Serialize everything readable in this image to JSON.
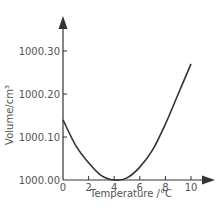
{
  "chart_data": {
    "type": "line",
    "title": "",
    "xlabel": "Temperature /°C",
    "ylabel": "Volume/cm³",
    "xlim": [
      0,
      10
    ],
    "ylim": [
      1000.0,
      1000.3
    ],
    "x_ticks": [
      "0",
      "2",
      "4",
      "6",
      "8",
      "10"
    ],
    "y_ticks": [
      "1000.00",
      "1000.10",
      "1000.20",
      "1000.30"
    ],
    "grid": false,
    "legend": null,
    "series": [
      {
        "name": "Volume of water",
        "x": [
          0,
          1,
          2,
          3,
          4,
          5,
          6,
          7,
          8,
          9,
          10
        ],
        "y": [
          1000.14,
          1000.08,
          1000.04,
          1000.01,
          1000.0,
          1000.005,
          1000.03,
          1000.07,
          1000.13,
          1000.2,
          1000.27
        ]
      }
    ],
    "colors": {
      "axis": "#333333",
      "curve": "#333333",
      "text": "#555555"
    }
  }
}
